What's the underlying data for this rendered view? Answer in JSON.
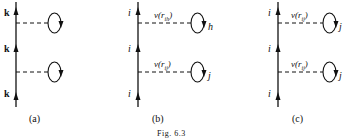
{
  "figure": {
    "caption": "Fig. 6.3",
    "panels": [
      {
        "id": "a",
        "label": "(a)",
        "line_labels": [
          "k",
          "k",
          "k"
        ],
        "interactions": [
          {
            "potential_label": "",
            "loop_label": ""
          },
          {
            "potential_label": "",
            "loop_label": ""
          }
        ]
      },
      {
        "id": "b",
        "label": "(b)",
        "line_labels": [
          "i",
          "i",
          "i"
        ],
        "interactions": [
          {
            "potential_label": "v(r",
            "potential_sub": "ih",
            "potential_close": ")",
            "loop_label": "h"
          },
          {
            "potential_label": "v(r",
            "potential_sub": "ij",
            "potential_close": ")",
            "loop_label": "j"
          }
        ]
      },
      {
        "id": "c",
        "label": "(c)",
        "line_labels": [
          "i",
          "i",
          "i"
        ],
        "interactions": [
          {
            "potential_label": "v(r",
            "potential_sub": "ij",
            "potential_close": ")",
            "loop_label": "j"
          },
          {
            "potential_label": "v(r",
            "potential_sub": "ij",
            "potential_close": ")",
            "loop_label": "j"
          }
        ]
      }
    ]
  }
}
